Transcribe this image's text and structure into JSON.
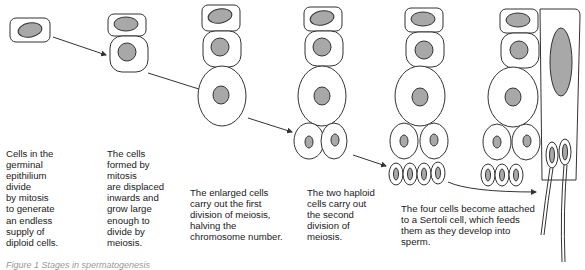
{
  "diagram": {
    "type": "spermatogenesis-stages",
    "colors": {
      "outline": "#333333",
      "nucleus": "#a8a8a8",
      "text": "#1a1a1a",
      "background": "#ffffff"
    },
    "stages": [
      {
        "id": 1,
        "label": "Cells in the\ngerminal\nepithilium\ndivide\nby mitosis\nto generate\nan endless\nsupply of\ndiploid cells."
      },
      {
        "id": 2,
        "label": "The cells\nformed by\nmitosis\nare displaced\ninwards and\ngrow large\nenough to\ndivide by\nmeiosis."
      },
      {
        "id": 3,
        "label": "The enlarged cells\ncarry out the first\ndivision of meiosis,\nhalving the\nchromosome number."
      },
      {
        "id": 4,
        "label": "The two haploid\ncells carry out\nthe second\ndivision of\nmeiosis."
      },
      {
        "id": 5,
        "label": "The four cells become attached\nto a Sertoli cell, which feeds\nthem as they develop into\nsperm."
      }
    ],
    "caption": "Figure 1 Stages in spermatogenesis"
  }
}
